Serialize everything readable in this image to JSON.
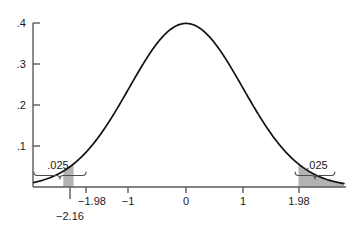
{
  "chart_data": {
    "type": "line",
    "title": "",
    "subtitle": "",
    "xlabel": "",
    "ylabel": "",
    "xlim": [
      -2.68,
      2.78
    ],
    "ylim": [
      0,
      0.42
    ],
    "grid": false,
    "legend": null,
    "distribution": "standard normal density",
    "x_tick_labels": [
      "−1.98",
      "−1",
      "0",
      "1",
      "1.98"
    ],
    "x_tick_values": [
      -1.98,
      -1,
      0,
      1,
      1.98
    ],
    "y_tick_labels": [
      ".4",
      ".3",
      ".2",
      ".1"
    ],
    "y_tick_values": [
      0.4,
      0.3,
      0.2,
      0.1
    ],
    "peak_value": 0.3989,
    "peak_x": 0,
    "series": [
      {
        "name": "standard normal density",
        "x": [
          -2.68,
          -2.5,
          -2.25,
          -2.16,
          -2.0,
          -1.98,
          -1.75,
          -1.5,
          -1.25,
          -1.0,
          -0.75,
          -0.5,
          -0.25,
          0,
          0.25,
          0.5,
          0.75,
          1.0,
          1.25,
          1.5,
          1.75,
          1.98,
          2.0,
          2.25,
          2.5,
          2.78
        ],
        "values": [
          0.011,
          0.0175,
          0.0317,
          0.0387,
          0.054,
          0.0562,
          0.0863,
          0.1295,
          0.1826,
          0.242,
          0.3011,
          0.3521,
          0.3867,
          0.3989,
          0.3867,
          0.3521,
          0.3011,
          0.242,
          0.1826,
          0.1295,
          0.0863,
          0.0562,
          0.054,
          0.0317,
          0.0175,
          0.0085
        ]
      }
    ],
    "shaded_regions": [
      {
        "name": "left-tail",
        "label": ".025",
        "probability": 0.025,
        "from": -2.16,
        "to": -1.98,
        "color": "#b3b3b3"
      },
      {
        "name": "right-tail",
        "label": ".025",
        "probability": 0.025,
        "from": 1.98,
        "to": 2.78,
        "color": "#b3b3b3"
      }
    ],
    "annotations": [
      {
        "name": "left-tail-probability",
        "text": ".025",
        "x": -1.72
      },
      {
        "name": "right-tail-probability",
        "text": ".025",
        "x": 2.32
      },
      {
        "name": "critical-value-extra",
        "text": "−2.16",
        "x": -2.16
      }
    ],
    "braces": [
      {
        "name": "left-brace",
        "from": -2.68,
        "to": -1.76
      },
      {
        "name": "right-brace",
        "from": 1.92,
        "to": 2.62
      }
    ],
    "colors": {
      "curve": "#111111",
      "axis": "#4d4d4d",
      "shading": "#b3b3b3",
      "text": "#1a1a1a",
      "background": "#ffffff"
    }
  },
  "axis": {
    "y_labels": [
      ".4",
      ".3",
      ".2",
      ".1"
    ],
    "x_labels": [
      "−1.98",
      "−1",
      "0",
      "1",
      "1.98"
    ]
  },
  "annotations": {
    "left_tail_prob": ".025",
    "right_tail_prob": ".025",
    "extra_critical_value": "−2.16"
  }
}
